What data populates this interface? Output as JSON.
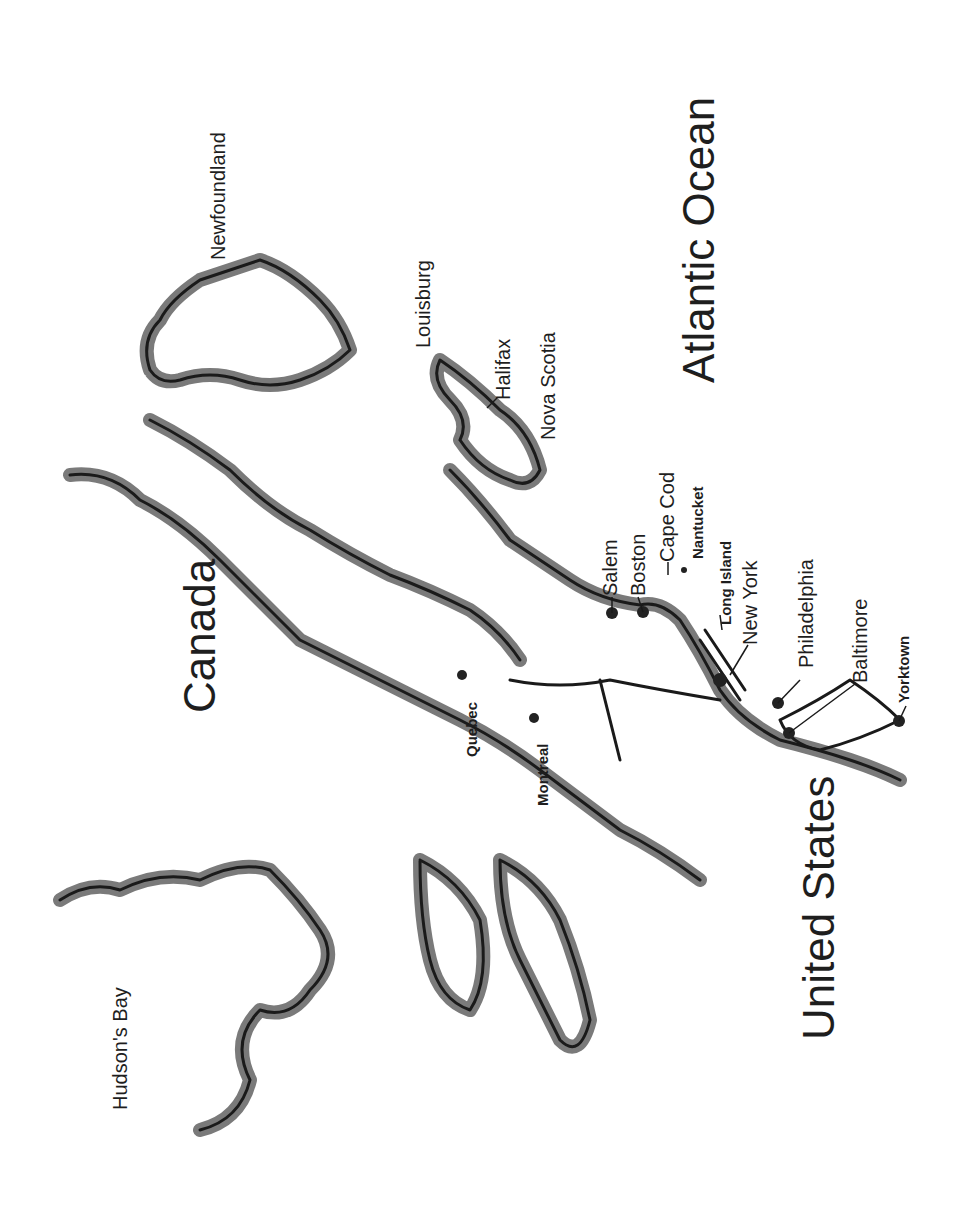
{
  "map": {
    "orientation": "rotated 90° counter-clockwise",
    "regions": {
      "canada": "Canada",
      "united_states": "United States",
      "atlantic_ocean": "Atlantic Ocean",
      "hudsons_bay": "Hudson's Bay",
      "newfoundland": "Newfoundland",
      "nova_scotia": "Nova Scotia"
    },
    "places": {
      "louisburg": "Louisburg",
      "halifax": "Halifax",
      "salem": "Salem",
      "boston": "Boston",
      "cape_cod": "Cape Cod",
      "nantucket": "Nantucket",
      "long_island": "Long Island",
      "new_york": "New York",
      "philadelphia": "Philadelphia",
      "baltimore": "Baltimore",
      "yorktown": "Yorktown",
      "quebec": "Quebec",
      "montreal": "Montreal"
    },
    "colors": {
      "land_shadow": "#7a7a7a",
      "coastline": "#1a1a1a",
      "background": "#ffffff",
      "city_dot": "#222222"
    }
  }
}
